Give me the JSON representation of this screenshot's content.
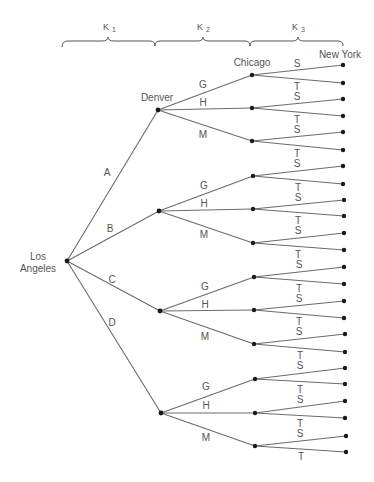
{
  "stages": [
    {
      "label": "K",
      "sub": "1"
    },
    {
      "label": "K",
      "sub": "2"
    },
    {
      "label": "K",
      "sub": "3"
    }
  ],
  "cities": {
    "origin_line1": "Los",
    "origin_line2": "Angeles",
    "stage1": "Denver",
    "stage2": "Chicago",
    "destination": "New York"
  },
  "first_branches": [
    "A",
    "B",
    "C",
    "D"
  ],
  "second_branches": [
    "G",
    "H",
    "M"
  ],
  "third_branches": [
    "S",
    "T"
  ],
  "colors": {
    "line": "#6b6b6b",
    "node": "#1a1a1a",
    "text": "#555555"
  }
}
